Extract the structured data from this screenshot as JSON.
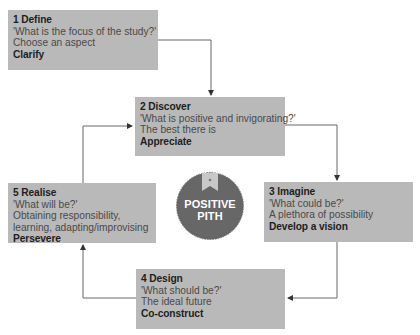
{
  "diagram": {
    "center_badge": {
      "line1": "POSITIVE",
      "line2": "PITH",
      "icon": "bookmark-icon"
    },
    "steps": [
      {
        "title": "1 Define",
        "question": "'What is the focus of the study?'",
        "description": "Choose an aspect",
        "action": "Clarify"
      },
      {
        "title": "2 Discover",
        "question": "'What is positive and invigorating?'",
        "description": "The best there is",
        "action": "Appreciate"
      },
      {
        "title": "3 Imagine",
        "question": "'What could be?'",
        "description": "A plethora of possibility",
        "action": "Develop a vision"
      },
      {
        "title": "4 Design",
        "question": "'What should be?'",
        "description": "The ideal future",
        "action": "Co-construct"
      },
      {
        "title": "5 Realise",
        "question": "'What will be?'",
        "description": "Obtaining responsibility, learning, adapting/improvising",
        "action": "Persevere"
      }
    ],
    "colors": {
      "box_fill": "#b9b9b9",
      "badge_fill": "#666666",
      "connector": "#555555",
      "ribbon": "#c8c8c8"
    }
  }
}
